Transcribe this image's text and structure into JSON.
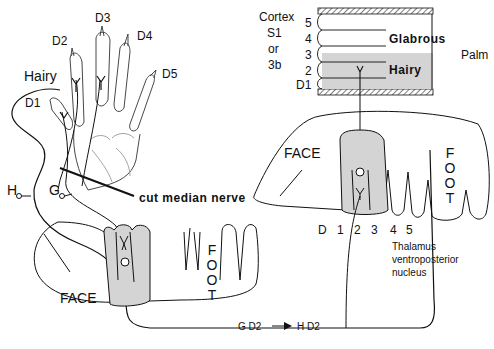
{
  "figure": {
    "hand": {
      "digit_labels": [
        "D1",
        "D2",
        "D3",
        "D4",
        "D5"
      ],
      "hairy_label": "Hairy",
      "nerve_labels": {
        "hairy": "H",
        "glabrous": "G"
      },
      "cut_label": "cut median nerve"
    },
    "cortex": {
      "title_lines": [
        "Cortex",
        "S1",
        "or",
        "3b"
      ],
      "row_labels": [
        "5",
        "4",
        "3",
        "2",
        "D1"
      ],
      "glabrous_label": "Glabrous",
      "hairy_label": "Hairy",
      "palm_label": "Palm"
    },
    "thalamus": {
      "face_label": "FACE",
      "foot_letters": [
        "F",
        "O",
        "O",
        "T"
      ],
      "digit_axis": [
        "D",
        "1",
        "2",
        "3",
        "4",
        "5"
      ],
      "caption_lines": [
        "Thalamus",
        "ventroposterior",
        "nucleus"
      ]
    },
    "lower_map": {
      "face_label": "FACE",
      "foot_letters": [
        "F",
        "O",
        "O",
        "T"
      ]
    },
    "remap": {
      "from": "G D2",
      "arrow": "→",
      "to": "H D2"
    },
    "colors": {
      "shade": "#d4d4d4",
      "line": "#111111",
      "hatch": "#555555"
    }
  }
}
